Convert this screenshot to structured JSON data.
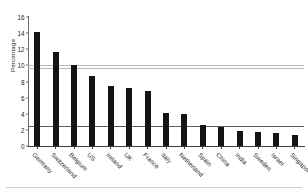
{
  "chart_data": {
    "type": "bar",
    "title": "",
    "xlabel": "",
    "ylabel": "Percentage",
    "ylim": [
      0,
      16
    ],
    "ytick_step": 2,
    "yticks": [
      0,
      2,
      4,
      6,
      8,
      10,
      12,
      14,
      16
    ],
    "grid": "horizontal-partial",
    "legend": "none",
    "bar_color": "#141414",
    "categories": [
      "Germany",
      "Switzerland",
      "Belgium",
      "US",
      "Ireland",
      "UK",
      "France",
      "Italy",
      "Netherland",
      "Spain",
      "China",
      "India",
      "Sweden",
      "Israel",
      "Singapore"
    ],
    "values": [
      14.1,
      11.6,
      10.1,
      8.7,
      7.5,
      7.2,
      6.8,
      4.1,
      4.0,
      2.6,
      2.3,
      1.9,
      1.8,
      1.6,
      1.4
    ]
  },
  "axes": {
    "y_axis_title": "Percentage",
    "y_tick_labels": [
      "16",
      "14",
      "12",
      "10",
      "8",
      "6",
      "4",
      "2",
      "0"
    ]
  },
  "colors": {
    "bar": "#141414",
    "axis": "#3d3d3d",
    "gridline": "#bdbdbd",
    "gridline_dark": "#5a5a5a"
  }
}
